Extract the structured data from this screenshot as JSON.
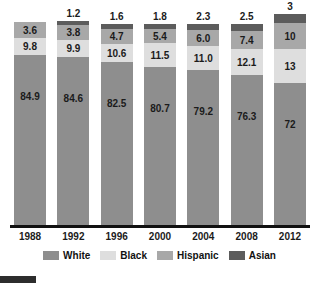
{
  "chart_data": {
    "type": "bar",
    "subtype": "stacked-bar-100",
    "title": "",
    "subtitle": "",
    "xlabel": "",
    "ylabel": "",
    "ylim": [
      0,
      100
    ],
    "grid": false,
    "legend_position": "bottom-center",
    "categories": [
      "1988",
      "1992",
      "1996",
      "2000",
      "2004",
      "2008",
      "2012"
    ],
    "stack_order_bottom_to_top": [
      "White",
      "Black",
      "Hispanic",
      "Asian"
    ],
    "series": [
      {
        "name": "White",
        "color": "#8e8e8e",
        "values": [
          84.9,
          84.6,
          82.5,
          80.7,
          79.2,
          76.3,
          72
        ]
      },
      {
        "name": "Black",
        "color": "#dedede",
        "values": [
          9.8,
          9.9,
          10.6,
          11.5,
          11.0,
          12.1,
          13
        ]
      },
      {
        "name": "Hispanic",
        "color": "#a8a8a8",
        "values": [
          3.6,
          3.8,
          4.7,
          5.4,
          6.0,
          7.4,
          10
        ]
      },
      {
        "name": "Asian",
        "color": "#5c5c5c",
        "values": [
          1.0,
          1.2,
          1.6,
          1.8,
          2.3,
          2.5,
          3
        ]
      }
    ],
    "data_labels": {
      "White": [
        "84.9",
        "84.6",
        "82.5",
        "80.7",
        "79.2",
        "76.3",
        "72"
      ],
      "Black": [
        "9.8",
        "9.9",
        "10.6",
        "11.5",
        "11.0",
        "12.1",
        "13"
      ],
      "Hispanic": [
        "3.6",
        "3.8",
        "4.7",
        "5.4",
        "6.0",
        "7.4",
        "10"
      ],
      "Asian": [
        "",
        "1.2",
        "1.6",
        "1.8",
        "2.3",
        "2.5",
        "3"
      ]
    }
  },
  "bars": [
    {
      "year": "1988",
      "asian_top_label": "",
      "asian_label": "",
      "asian_height": 0,
      "hispanic_label": "3.6",
      "hispanic_height": 16,
      "black_label": "9.8",
      "black_height": 17,
      "white_label": "84.9",
      "white_height": 170
    },
    {
      "year": "1992",
      "asian_top_label": "1.2",
      "asian_label": "",
      "asian_height": 4,
      "hispanic_label": "3.8",
      "hispanic_height": 15,
      "black_label": "9.9",
      "black_height": 17,
      "white_label": "84.6",
      "white_height": 168
    },
    {
      "year": "1996",
      "asian_top_label": "1.6",
      "asian_label": "",
      "asian_height": 5,
      "hispanic_label": "4.7",
      "hispanic_height": 15,
      "black_label": "10.6",
      "black_height": 18,
      "white_label": "82.5",
      "white_height": 163
    },
    {
      "year": "2000",
      "asian_top_label": "1.8",
      "asian_label": "",
      "asian_height": 5,
      "hispanic_label": "5.4",
      "hispanic_height": 14,
      "black_label": "11.5",
      "black_height": 24,
      "white_label": "80.7",
      "white_height": 158
    },
    {
      "year": "2004",
      "asian_top_label": "2.3",
      "asian_label": "",
      "asian_height": 6,
      "hispanic_label": "6.0",
      "hispanic_height": 16,
      "black_label": "11.0",
      "black_height": 24,
      "white_label": "79.2",
      "white_height": 155
    },
    {
      "year": "2008",
      "asian_top_label": "2.5",
      "asian_label": "",
      "asian_height": 7,
      "hispanic_label": "7.4",
      "hispanic_height": 18,
      "black_label": "12.1",
      "black_height": 26,
      "white_label": "76.3",
      "white_height": 150
    },
    {
      "year": "2012",
      "asian_top_label": "3",
      "asian_label": "",
      "asian_height": 9,
      "hispanic_label": "10",
      "hispanic_height": 26,
      "black_label": "13",
      "black_height": 34,
      "white_label": "72",
      "white_height": 142
    }
  ],
  "x_axis": {
    "ticks": [
      "1988",
      "1992",
      "1996",
      "2000",
      "2004",
      "2008",
      "2012"
    ]
  },
  "legend": {
    "items": [
      {
        "label": "White",
        "color": "#8e8e8e"
      },
      {
        "label": "Black",
        "color": "#dedede"
      },
      {
        "label": "Hispanic",
        "color": "#a8a8a8"
      },
      {
        "label": "Asian",
        "color": "#5c5c5c"
      }
    ]
  }
}
